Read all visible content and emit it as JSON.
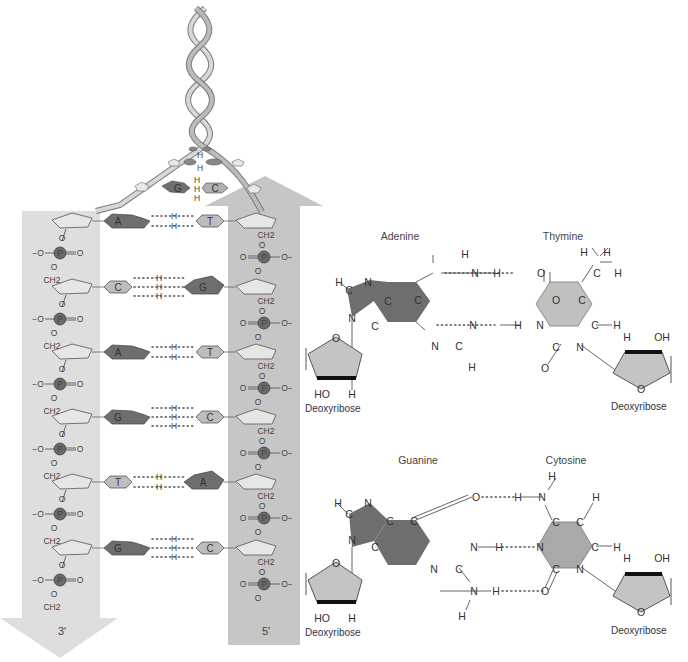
{
  "colors": {
    "strand_left": "#dcdcdc",
    "strand_right": "#c8c8c8",
    "purine": "#6e6e6e",
    "pyrimidine": "#bdbdbd",
    "phosphorus": "#6a6a6a",
    "sugar": "#c4c4c4",
    "text": "#333333"
  },
  "helix_model": {
    "strand_labels": {
      "left": "3′",
      "right": "5′"
    },
    "backbone_atoms": {
      "phosphorus": "P",
      "oxygen": "O",
      "oxygen_negative": "−O",
      "oxygen_negative_right": "O−",
      "methylene": "CH2",
      "hydrogen": "H"
    },
    "base_pairs": [
      {
        "left": "A",
        "right": "T",
        "h_bonds": 2
      },
      {
        "left": "C",
        "right": "G",
        "h_bonds": 3
      },
      {
        "left": "A",
        "right": "T",
        "h_bonds": 2
      },
      {
        "left": "G",
        "right": "C",
        "h_bonds": 3
      },
      {
        "left": "T",
        "right": "A",
        "h_bonds": 2
      },
      {
        "left": "G",
        "right": "C",
        "h_bonds": 3
      }
    ],
    "twist_pairs": [
      {
        "left": "G",
        "right": "C"
      }
    ]
  },
  "structures": {
    "at_pair": {
      "left_title": "Adenine",
      "right_title": "Thymine",
      "left_sugar_label": "Deoxyribose",
      "right_sugar_label": "Deoxyribose"
    },
    "gc_pair": {
      "left_title": "Guanine",
      "right_title": "Cytosine",
      "left_sugar_label": "Deoxyribose",
      "right_sugar_label": "Deoxyribose"
    },
    "atoms": {
      "H": "H",
      "N": "N",
      "C": "C",
      "O": "O",
      "OH": "OH",
      "HO": "HO"
    }
  }
}
